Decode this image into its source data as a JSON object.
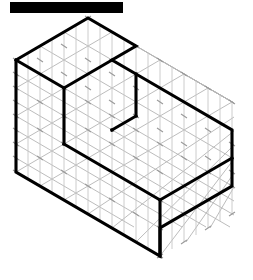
{
  "page": {
    "background_color": "#ffffff",
    "width": 253,
    "height": 280
  },
  "header": {
    "redaction_bar": {
      "label": "",
      "color": "#000000",
      "x": 10,
      "y": 2,
      "width": 113,
      "height": 11
    }
  },
  "figure": {
    "title": "",
    "grid": {
      "color": "#b4b4b4",
      "vertical_color": "#c8c8c8",
      "line_width": 0.9,
      "cell_width": 24,
      "cell_height": 14,
      "origin_x": 16,
      "origin_y": 172,
      "columns": 10,
      "rows": 9,
      "tick_marks": true,
      "tick_color": "#8c8c8c"
    },
    "solid": {
      "stroke_color": "#000000",
      "stroke_width": 3.1,
      "fill": "none",
      "vertices": {
        "top_back": [
          90,
          17
        ],
        "top_left": [
          16,
          60
        ],
        "top_right_step": [
          138,
          60
        ],
        "step_inner": [
          114,
          88
        ],
        "left_inner_bottom": [
          55,
          88
        ],
        "step_bottom": [
          138,
          116
        ],
        "front_mid": [
          90,
          144
        ],
        "right_top": [
          234,
          130
        ],
        "left_bottom": [
          16,
          172
        ],
        "right_bottom": [
          234,
          180
        ],
        "bottom_front": [
          162,
          256
        ],
        "front_bottom_left": [
          16,
          172
        ]
      },
      "outline_path": "M 16 60 L 90 17 L 138 60 L 114 88 L 138 116 L 234 130 L 234 180 L 162 256 L 16 172 Z",
      "interior_edges": [
        "M 16 60 L 114 88",
        "M 55 88 L 55 172",
        "M 114 88 L 114 172",
        "M 114 172 L 234 130",
        "M 162 200 L 162 256",
        "M 138 60 L 138 116"
      ]
    }
  }
}
